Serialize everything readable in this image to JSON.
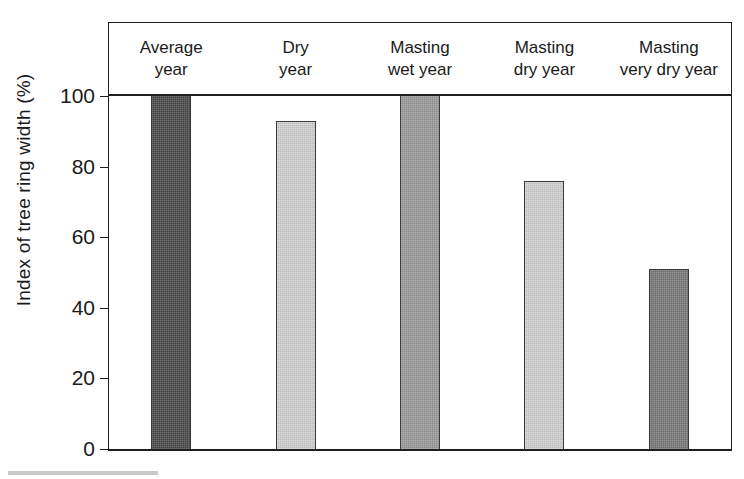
{
  "chart_data": {
    "type": "bar",
    "title": "",
    "xlabel": "",
    "ylabel": "Index of tree ring width (%)",
    "ylim": [
      0,
      100
    ],
    "yticks": [
      0,
      20,
      40,
      60,
      80,
      100
    ],
    "ytick_labels": [
      "0",
      "20",
      "40",
      "60",
      "80",
      "100"
    ],
    "grid": false,
    "legend": "none",
    "categories": [
      "Average\nyear",
      "Dry\nyear",
      "Masting\nwet year",
      "Masting\ndry year",
      "Masting\nvery dry year"
    ],
    "category_lines": [
      [
        "Average",
        "year"
      ],
      [
        "Dry",
        "year"
      ],
      [
        "Masting",
        "wet year"
      ],
      [
        "Masting",
        "dry year"
      ],
      [
        "Masting",
        "very dry year"
      ]
    ],
    "values": [
      100,
      93,
      100,
      76,
      51
    ],
    "bar_colors": [
      "#4a4a4a",
      "#d4d4d4",
      "#9c9c9c",
      "#d4d4d4",
      "#7a7a7a"
    ],
    "bar_edge_color": "#3a3a3a",
    "axis_color": "#1f1f1f",
    "background_color": "#ffffff"
  }
}
